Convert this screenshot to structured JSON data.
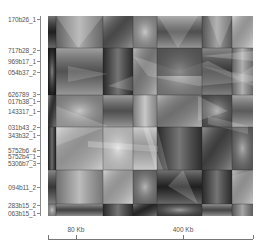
{
  "chart_data": {
    "type": "heatmap",
    "title": "",
    "colormap": "grayscale",
    "y_labels": [
      {
        "label": "170b26_1",
        "y": 19
      },
      {
        "label": "717b28_2",
        "y": 50
      },
      {
        "label": "969b17_1",
        "y": 61
      },
      {
        "label": "054b37_2",
        "y": 72
      },
      {
        "label": "626789_3",
        "y": 94
      },
      {
        "label": "017b38_1",
        "y": 101
      },
      {
        "label": "143317_1",
        "y": 111
      },
      {
        "label": "031b43_2",
        "y": 127
      },
      {
        "label": "343b32_1",
        "y": 135
      },
      {
        "label": "5752b6_4",
        "y": 150
      },
      {
        "label": "5752b4_1",
        "y": 156
      },
      {
        "label": "5306b7_3",
        "y": 163
      },
      {
        "label": "094b11_2",
        "y": 187
      },
      {
        "label": "283b15_2",
        "y": 205
      },
      {
        "label": "063b15_1",
        "y": 213
      }
    ],
    "x_axis": {
      "ticks": [
        {
          "label": "80 Kb",
          "x": 76
        },
        {
          "label": "400 Kb",
          "x": 183
        }
      ],
      "range_px": [
        48,
        253
      ]
    },
    "block_boundaries_x": [
      0,
      8,
      55,
      85,
      109,
      154,
      184,
      205
    ],
    "block_boundaries_y": [
      0,
      32,
      79,
      111,
      154,
      188,
      200
    ],
    "block_shades": [
      [
        "#2a2a2a",
        "#8a8a8a",
        "#5a5a5a",
        "#9a9a9a",
        "#6a6a6a",
        "#7a7a7a",
        "#b8b8b8"
      ],
      [
        "#1e1e1e",
        "#6e6e6e",
        "#3a3a3a",
        "#909090",
        "#8c8c8c",
        "#4a4a4a",
        "#8e8e8e"
      ],
      [
        "#3a3a3a",
        "#9a9a9a",
        "#6a6a6a",
        "#b0b0b0",
        "#8a8a8a",
        "#5a5a5a",
        "#7a7a7a"
      ],
      [
        "#2c2c2c",
        "#b4b4b4",
        "#c8c8c8",
        "#a8a8a8",
        "#3c3c3c",
        "#4c4c4c",
        "#6c6c6c"
      ],
      [
        "#4a4a4a",
        "#a0a0a0",
        "#b8b8b8",
        "#7a7a7a",
        "#2a2a2a",
        "#3a3a3a",
        "#9a9a9a"
      ],
      [
        "#9a9a9a",
        "#5a5a5a",
        "#3a3a3a",
        "#2e2e2e",
        "#4a4a4a",
        "#5e5e5e",
        "#7e7e7e"
      ]
    ]
  }
}
